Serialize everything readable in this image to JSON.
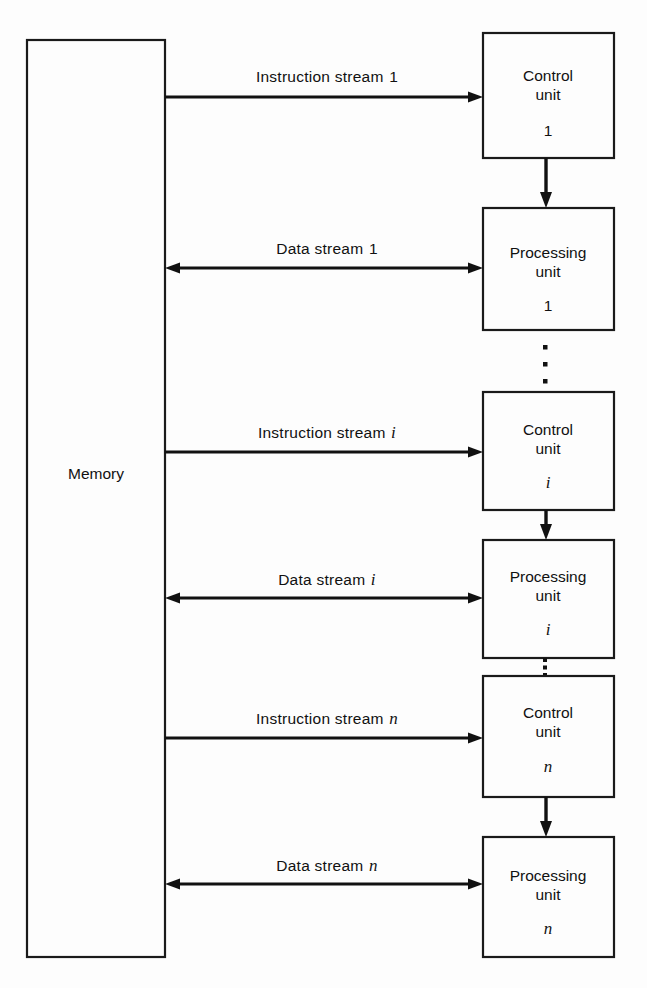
{
  "diagram": {
    "background_color": "#fdfdfd",
    "line_color": "#111111",
    "memory": {
      "label": "Memory"
    },
    "groups": [
      {
        "index_label": "1",
        "index_italic": false,
        "instruction_stream_label": "Instruction stream",
        "data_stream_label": "Data stream",
        "control_unit_label_line1": "Control",
        "control_unit_label_line2": "unit",
        "processing_unit_label_line1": "Processing",
        "processing_unit_label_line2": "unit"
      },
      {
        "index_label": "i",
        "index_italic": true,
        "instruction_stream_label": "Instruction stream",
        "data_stream_label": "Data stream",
        "control_unit_label_line1": "Control",
        "control_unit_label_line2": "unit",
        "processing_unit_label_line1": "Processing",
        "processing_unit_label_line2": "unit"
      },
      {
        "index_label": "n",
        "index_italic": true,
        "instruction_stream_label": "Instruction stream",
        "data_stream_label": "Data stream",
        "control_unit_label_line1": "Control",
        "control_unit_label_line2": "unit",
        "processing_unit_label_line1": "Processing",
        "processing_unit_label_line2": "unit"
      }
    ],
    "ellipses": [
      {
        "name": "ellipsis-between-group-1-and-i",
        "dots": 3
      },
      {
        "name": "ellipsis-between-group-i-and-n",
        "dots": 3
      }
    ]
  }
}
